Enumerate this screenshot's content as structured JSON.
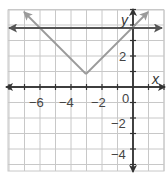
{
  "chart_data": {
    "type": "line",
    "title": "",
    "xlabel": "x",
    "ylabel": "y",
    "xlim": [
      -8,
      2
    ],
    "ylim": [
      -5.2,
      5
    ],
    "grid": true,
    "x_ticks": [
      -6,
      -4,
      -2,
      0
    ],
    "x_tick_labels": [
      "−6",
      "−4",
      "−2",
      "0"
    ],
    "y_ticks": [
      2,
      -2,
      -4
    ],
    "y_tick_labels": [
      "2",
      "−2",
      "−4"
    ],
    "series": [
      {
        "name": "y = |x + 3| + 1",
        "points": [
          [
            -7,
            5
          ],
          [
            -3,
            1
          ],
          [
            1,
            5
          ]
        ],
        "color": "#9a9a9a",
        "arrows": "both"
      },
      {
        "name": "y = 4",
        "points": [
          [
            -8,
            4
          ],
          [
            2,
            4
          ]
        ],
        "color": "#555555",
        "arrows": "both"
      }
    ],
    "vertex": [
      -3,
      1
    ]
  },
  "axes": {
    "x_label": "x",
    "y_label": "y"
  },
  "colors": {
    "grid": "#c8c8c8",
    "axis": "#333333",
    "v_graph": "#9a9a9a",
    "horizontal_line": "#555555"
  }
}
